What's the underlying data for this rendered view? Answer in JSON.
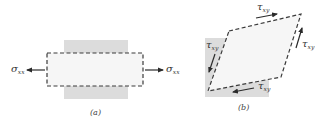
{
  "colors": {
    "background": "#ffffff",
    "shaded_square": "#dcdcdc",
    "element_fill": "#f6f6f6",
    "dashed_line": "#3a3a3a",
    "arrow": "#2a2a2a",
    "text": "#333333"
  },
  "panel_a": {
    "caption": "(a)",
    "left_stress": {
      "symbol": "σ",
      "subscript": "xx"
    },
    "right_stress": {
      "symbol": "σ",
      "subscript": "xx"
    }
  },
  "panel_b": {
    "caption": "(b)",
    "top_shear": {
      "symbol": "τ",
      "subscript": "xy"
    },
    "right_shear": {
      "symbol": "τ",
      "subscript": "xy"
    },
    "left_shear": {
      "symbol": "τ",
      "subscript": "xy"
    },
    "bottom_shear": {
      "symbol": "τ",
      "subscript": "xy"
    }
  }
}
